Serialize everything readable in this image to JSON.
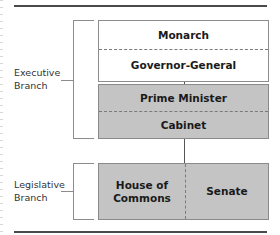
{
  "diagram": {
    "title": "",
    "groups": [
      {
        "id": "executive",
        "label_lines": [
          "Executive",
          "Branch"
        ]
      },
      {
        "id": "legislative",
        "label_lines": [
          "Legislative",
          "Branch"
        ]
      }
    ],
    "boxes": {
      "crown": {
        "fill": "#ffffff",
        "cells": [
          "Monarch",
          "Governor-General"
        ]
      },
      "government": {
        "fill": "#c4c4c4",
        "cells": [
          "Prime Minister",
          "Cabinet"
        ]
      },
      "parliament": {
        "fill": "#c4c4c4",
        "cells": [
          "House of Commons",
          "Senate"
        ],
        "cell_lines": [
          [
            "House of",
            "Commons"
          ],
          [
            "Senate"
          ]
        ]
      }
    },
    "connections": [
      {
        "from": "Governor-General",
        "to": "Prime Minister"
      },
      {
        "from": "Cabinet",
        "to": "Parliament"
      }
    ],
    "colors": {
      "rule": "#4a4a4a",
      "border": "#8c8c8c",
      "gray_fill": "#c4c4c4",
      "text": "#1a1a1a"
    }
  }
}
